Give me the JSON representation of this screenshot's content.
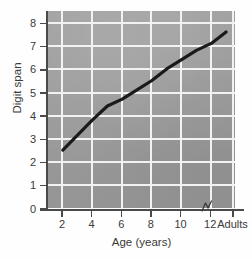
{
  "chart_data": {
    "type": "line",
    "title": "",
    "xlabel": "Age (years)",
    "ylabel": "Digit span",
    "x_tick_labels": [
      "2",
      "4",
      "6",
      "8",
      "10",
      "12",
      "Adults"
    ],
    "y_tick_labels": [
      "0",
      "1",
      "2",
      "3",
      "4",
      "5",
      "6",
      "7",
      "8"
    ],
    "x": [
      2,
      4,
      5,
      6,
      7,
      8,
      9,
      10,
      11,
      12,
      13
    ],
    "values": [
      2.5,
      3.8,
      4.4,
      4.7,
      5.1,
      5.5,
      6.0,
      6.4,
      6.8,
      7.1,
      7.6
    ],
    "xlim": [
      1,
      13.6
    ],
    "ylim": [
      0,
      8.5
    ],
    "grid": true,
    "legend": "none",
    "axis_break": "between 12 and Adults",
    "series": [
      {
        "name": "Digit span",
        "values": [
          2.5,
          3.8,
          4.4,
          4.7,
          5.1,
          5.5,
          6.0,
          6.4,
          6.8,
          7.1,
          7.6
        ]
      }
    ],
    "colors": {
      "plot_background": "#9a9a9a",
      "gridline": "#f2f2f2",
      "line": "#1a1a1a",
      "axis": "#4a4a4a",
      "text": "#3a3a3a",
      "figure_background": "#fefefe"
    }
  }
}
